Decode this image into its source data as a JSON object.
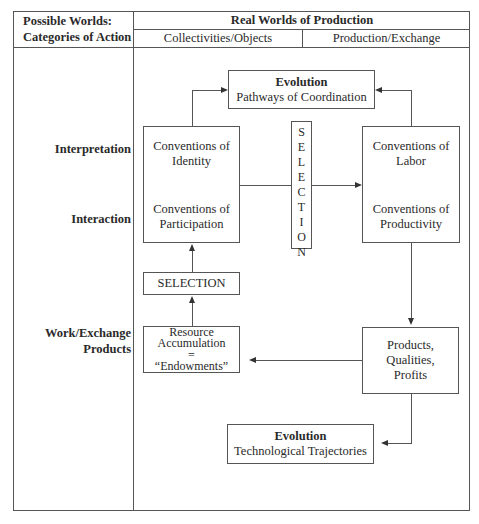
{
  "header": {
    "left_title_line1": "Possible Worlds:",
    "left_title_line2": "Categories of Action",
    "right_title": "Real Worlds of Production",
    "sub_col1": "Collectivities/Objects",
    "sub_col2": "Production/Exchange"
  },
  "row_labels": {
    "interpretation": "Interpretation",
    "interaction": "Interaction",
    "work_line1": "Work/Exchange",
    "work_line2": "Products"
  },
  "boxes": {
    "evolution_top": {
      "title": "Evolution",
      "subtitle": "Pathways of Coordination"
    },
    "identity": {
      "line1": "Conventions of",
      "line2": "Identity"
    },
    "participation": {
      "line1": "Conventions of",
      "line2": "Participation"
    },
    "labor": {
      "line1": "Conventions of",
      "line2": "Labor"
    },
    "productivity": {
      "line1": "Conventions of",
      "line2": "Productivity"
    },
    "selection_vertical": [
      "S",
      "E",
      "L",
      "E",
      "C",
      "T",
      "I",
      "O",
      "N"
    ],
    "selection_horizontal": "SELECTION",
    "resource": {
      "line1": "Resource",
      "line2": "Accumulation",
      "line3": "=",
      "line4": "“Endowments”"
    },
    "products": {
      "line1": "Products,",
      "line2": "Qualities,",
      "line3": "Profits"
    },
    "evolution_bottom": {
      "title": "Evolution",
      "subtitle": "Technological Trajectories"
    }
  }
}
